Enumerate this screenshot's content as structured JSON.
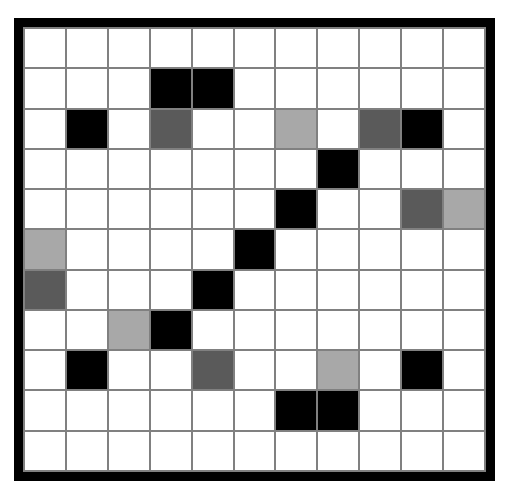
{
  "grid": {
    "title": "Grid Pattern",
    "rows": 11,
    "columns": 11,
    "border_color": "#000000",
    "gridline_color": "#808080",
    "palette": {
      "white": "#ffffff",
      "black": "#000000",
      "dark_gray": "#5a5a5a",
      "light_gray": "#a8a8a8"
    },
    "legend": [
      {
        "key": "white",
        "label": "Empty",
        "color": "#ffffff"
      },
      {
        "key": "black",
        "label": "Filled",
        "color": "#000000"
      },
      {
        "key": "dark",
        "label": "Dark Gray",
        "color": "#5a5a5a"
      },
      {
        "key": "light",
        "label": "Light Gray",
        "color": "#a8a8a8"
      }
    ],
    "cells": [
      [
        "white",
        "white",
        "white",
        "white",
        "white",
        "white",
        "white",
        "white",
        "white",
        "white",
        "white"
      ],
      [
        "white",
        "white",
        "white",
        "black",
        "black",
        "white",
        "white",
        "white",
        "white",
        "white",
        "white"
      ],
      [
        "white",
        "black",
        "white",
        "dark",
        "white",
        "white",
        "light",
        "white",
        "dark",
        "black",
        "white"
      ],
      [
        "white",
        "white",
        "white",
        "white",
        "white",
        "white",
        "white",
        "black",
        "white",
        "white",
        "white"
      ],
      [
        "white",
        "white",
        "white",
        "white",
        "white",
        "white",
        "black",
        "white",
        "white",
        "dark",
        "light"
      ],
      [
        "light",
        "white",
        "white",
        "white",
        "white",
        "black",
        "white",
        "white",
        "white",
        "white",
        "white"
      ],
      [
        "dark",
        "white",
        "white",
        "white",
        "black",
        "white",
        "white",
        "white",
        "white",
        "white",
        "white"
      ],
      [
        "white",
        "white",
        "light",
        "black",
        "white",
        "white",
        "white",
        "white",
        "white",
        "white",
        "white"
      ],
      [
        "white",
        "black",
        "white",
        "white",
        "dark",
        "white",
        "white",
        "light",
        "white",
        "black",
        "white"
      ],
      [
        "white",
        "white",
        "white",
        "white",
        "white",
        "white",
        "black",
        "black",
        "white",
        "white",
        "white"
      ],
      [
        "white",
        "white",
        "white",
        "white",
        "white",
        "white",
        "white",
        "white",
        "white",
        "white",
        "white"
      ]
    ],
    "counts": {
      "black": 13,
      "dark_gray": 5,
      "light_gray": 5,
      "white": 98
    }
  },
  "chart_data": {
    "type": "heatmap",
    "xlabel": "",
    "ylabel": "",
    "rows": 11,
    "columns": 11,
    "x": [
      0,
      1,
      2,
      3,
      4,
      5,
      6,
      7,
      8,
      9,
      10
    ],
    "y": [
      0,
      1,
      2,
      3,
      4,
      5,
      6,
      7,
      8,
      9,
      10
    ],
    "value_map": {
      "white": 0,
      "light": 1,
      "dark": 2,
      "black": 3
    },
    "color_map": {
      "0": "#ffffff",
      "1": "#a8a8a8",
      "2": "#5a5a5a",
      "3": "#000000"
    },
    "values": [
      [
        0,
        0,
        0,
        0,
        0,
        0,
        0,
        0,
        0,
        0,
        0
      ],
      [
        0,
        0,
        0,
        3,
        3,
        0,
        0,
        0,
        0,
        0,
        0
      ],
      [
        0,
        3,
        0,
        2,
        0,
        0,
        1,
        0,
        2,
        3,
        0
      ],
      [
        0,
        0,
        0,
        0,
        0,
        0,
        0,
        3,
        0,
        0,
        0
      ],
      [
        0,
        0,
        0,
        0,
        0,
        0,
        3,
        0,
        0,
        2,
        1
      ],
      [
        1,
        0,
        0,
        0,
        0,
        3,
        0,
        0,
        0,
        0,
        0
      ],
      [
        2,
        0,
        0,
        0,
        3,
        0,
        0,
        0,
        0,
        0,
        0
      ],
      [
        0,
        0,
        1,
        3,
        0,
        0,
        0,
        0,
        0,
        0,
        0
      ],
      [
        0,
        3,
        0,
        0,
        2,
        0,
        0,
        1,
        0,
        3,
        0
      ],
      [
        0,
        0,
        0,
        0,
        0,
        0,
        3,
        3,
        0,
        0,
        0
      ],
      [
        0,
        0,
        0,
        0,
        0,
        0,
        0,
        0,
        0,
        0,
        0
      ]
    ],
    "grid": true,
    "legend": "none"
  }
}
